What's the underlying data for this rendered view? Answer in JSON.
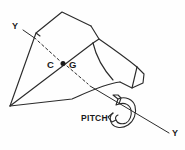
{
  "figure": {
    "background_color": "#fefefe",
    "line_color": "#2b2b2b",
    "text_color": "#1a1a1a",
    "width": 185,
    "height": 150
  },
  "labels": {
    "axis_y_top": "Y",
    "cg_left": "C",
    "cg_right": "G",
    "motion": "PITCH",
    "axis_y_bottom": "Y"
  },
  "annotations": {
    "axis_name": "Y",
    "center_of_gravity": "C G",
    "rotation": "PITCH"
  },
  "geometry": {
    "cg_point": {
      "x": 63,
      "y": 63
    },
    "axis_line_start": {
      "x": 22,
      "y": 30
    },
    "axis_line_end": {
      "x": 168,
      "y": 133
    },
    "wing_apex": {
      "x": 10,
      "y": 106
    }
  }
}
